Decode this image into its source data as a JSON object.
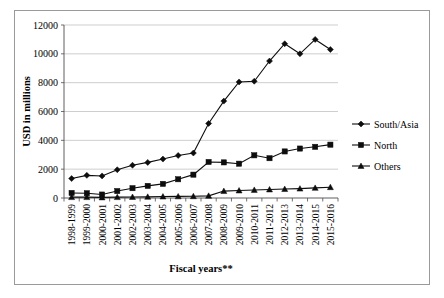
{
  "chart_data": {
    "type": "line",
    "title": "",
    "xlabel": "Fiscal years**",
    "ylabel": "USD in millions",
    "ylim": [
      0,
      12000
    ],
    "ytick_step": 2000,
    "yticks": [
      "0",
      "2000",
      "4000",
      "6000",
      "8000",
      "10000",
      "12000"
    ],
    "grid": true,
    "legend_position": "right",
    "categories": [
      "1998-1999",
      "1999-2000",
      "2000-2001",
      "2001-2002",
      "2002-2003",
      "2003-2004",
      "2004-2005",
      "2005-2006",
      "2006-2007",
      "2007-2008",
      "2008-2009",
      "2009-2010",
      "2010-2011",
      "2011-2012",
      "2012-2013",
      "2013-2014",
      "2014-2015",
      "2015-2016"
    ],
    "series": [
      {
        "name": "South/Asia",
        "marker": "diamond",
        "values": [
          1350,
          1570,
          1530,
          1960,
          2270,
          2470,
          2700,
          2950,
          3120,
          5170,
          6720,
          8050,
          8100,
          9500,
          10700,
          10000,
          11000,
          10300
        ]
      },
      {
        "name": "North",
        "marker": "square",
        "values": [
          350,
          330,
          240,
          480,
          680,
          840,
          980,
          1300,
          1620,
          2500,
          2470,
          2380,
          2960,
          2760,
          3230,
          3430,
          3550,
          3700
        ]
      },
      {
        "name": "Others",
        "marker": "triangle",
        "values": [
          60,
          60,
          40,
          60,
          70,
          80,
          100,
          110,
          120,
          150,
          480,
          520,
          560,
          590,
          620,
          650,
          700,
          750
        ]
      }
    ]
  },
  "legend": {
    "items": [
      {
        "label": "South/Asia",
        "marker": "diamond"
      },
      {
        "label": "North",
        "marker": "square"
      },
      {
        "label": "Others",
        "marker": "triangle"
      }
    ]
  },
  "axes": {
    "y_title": "USD in millions",
    "x_title": "Fiscal years**"
  },
  "colors": {
    "series": "#0d0d0d",
    "grid": "#b9b9b9",
    "axis": "#4d4d4d",
    "frame": "#9a9a9a",
    "background": "#ffffff"
  }
}
